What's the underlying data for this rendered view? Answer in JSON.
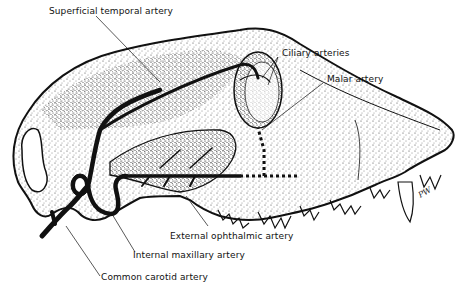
{
  "figure": {
    "labels": {
      "superficial_temporal": "Superficial temporal artery",
      "ciliary": "Ciliary arteries",
      "malar": "Malar artery",
      "external_ophthalmic": "External ophthalmic artery",
      "internal_maxillary": "Internal maxillary artery",
      "common_carotid": "Common carotid artery"
    },
    "signature": "PW",
    "colors": {
      "ink": "#111111",
      "background": "#ffffff"
    }
  }
}
